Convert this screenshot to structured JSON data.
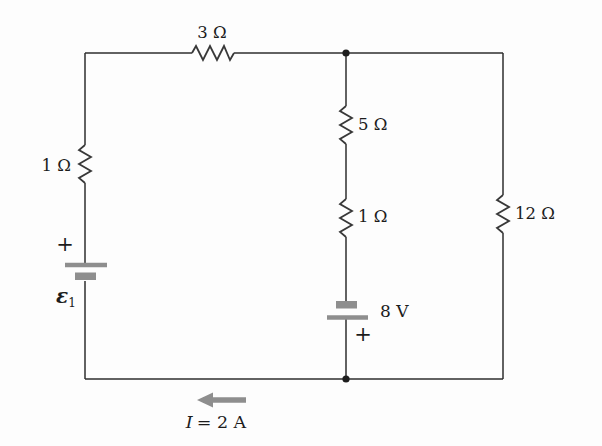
{
  "diagram": {
    "kind": "electric-circuit-schematic",
    "background_color": "#fdfdfd",
    "wire_color": "#2e2e2e",
    "accent_gray": "#8e8e8e",
    "resistors": {
      "top": {
        "label": "3 Ω",
        "location": "top wire"
      },
      "left": {
        "label": "1 Ω",
        "location": "left branch"
      },
      "middle_upper": {
        "label": "5 Ω",
        "location": "middle branch"
      },
      "middle_lower": {
        "label": "1 Ω",
        "location": "middle branch"
      },
      "right": {
        "label": "12 Ω",
        "location": "right branch"
      }
    },
    "batteries": {
      "left": {
        "symbol": "ε",
        "subscript": "1",
        "plus_sign": "+",
        "positive_terminal": "top"
      },
      "middle": {
        "label": "8 V",
        "plus_sign": "+",
        "positive_terminal": "bottom"
      }
    },
    "current_arrow": {
      "symbol": "I",
      "value_text": "= 2 A",
      "direction": "left"
    }
  }
}
